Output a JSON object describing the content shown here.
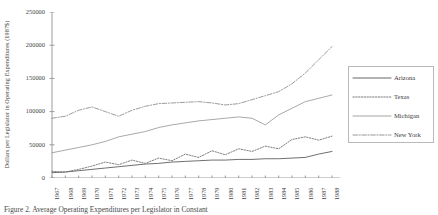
{
  "figure": {
    "caption": "Figure 2.   Average Operating Expenditures per Legislator in Constant"
  },
  "legend": {
    "position": "right",
    "items": [
      {
        "label": "Arizona",
        "style": "solid",
        "color": "#555555"
      },
      {
        "label": "Texas",
        "style": "dotted",
        "color": "#6b6b6b"
      },
      {
        "label": "Michigan",
        "style": "solid",
        "color": "#9a9a9a"
      },
      {
        "label": "New York",
        "style": "dashdot",
        "color": "#8a8a8a"
      }
    ]
  },
  "chart_data": {
    "type": "line",
    "title": "",
    "xlabel": "",
    "ylabel": "Dollars per Legislator in Operating Expenditures (1987$)",
    "xlim": [
      1967,
      1988
    ],
    "ylim": [
      0,
      250000
    ],
    "yticks": [
      0,
      50000,
      100000,
      150000,
      200000,
      250000
    ],
    "ytick_labels": [
      "0",
      "50000",
      "100000",
      "150000",
      "200000",
      "250000"
    ],
    "grid": false,
    "x": [
      1967,
      1968,
      1969,
      1970,
      1971,
      1972,
      1973,
      1974,
      1975,
      1976,
      1977,
      1978,
      1979,
      1980,
      1981,
      1982,
      1983,
      1984,
      1985,
      1986,
      1987,
      1988
    ],
    "xtick_labels": [
      "1967",
      "1968",
      "1969",
      "1970",
      "1971",
      "1972",
      "1973",
      "1974",
      "1975",
      "1976",
      "1977",
      "1978",
      "1979",
      "1980",
      "1981",
      "1982",
      "1983",
      "1984",
      "1985",
      "1986",
      "1987",
      "1988"
    ],
    "series": [
      {
        "name": "Arizona",
        "style": "solid",
        "color": "#555555",
        "values": [
          8000,
          9000,
          11000,
          13000,
          15000,
          17000,
          19000,
          21000,
          22000,
          24000,
          25000,
          26000,
          27000,
          27000,
          28000,
          28000,
          29000,
          29000,
          30000,
          31000,
          36000,
          40000
        ]
      },
      {
        "name": "Texas",
        "style": "dotted",
        "color": "#6b6b6b",
        "values": [
          10000,
          9000,
          13000,
          18000,
          24000,
          20000,
          27000,
          22000,
          30000,
          26000,
          36000,
          31000,
          41000,
          35000,
          44000,
          40000,
          48000,
          44000,
          58000,
          62000,
          57000,
          63000
        ]
      },
      {
        "name": "Michigan",
        "style": "solid",
        "color": "#9a9a9a",
        "values": [
          38000,
          42000,
          46000,
          50000,
          55000,
          62000,
          66000,
          70000,
          76000,
          80000,
          83000,
          86000,
          88000,
          90000,
          92000,
          90000,
          80000,
          95000,
          105000,
          115000,
          120000,
          125000
        ]
      },
      {
        "name": "New York",
        "style": "dashdot",
        "color": "#8a8a8a",
        "values": [
          90000,
          93000,
          102000,
          107000,
          100000,
          93000,
          102000,
          108000,
          112000,
          113000,
          114000,
          115000,
          113000,
          110000,
          112000,
          118000,
          124000,
          130000,
          142000,
          158000,
          178000,
          198000
        ]
      }
    ]
  }
}
